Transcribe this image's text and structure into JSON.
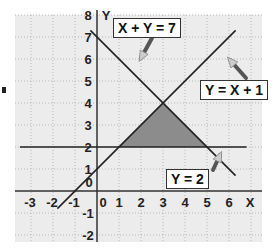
{
  "chart_data": {
    "type": "line",
    "title": "",
    "xlabel": "X",
    "ylabel": "Y",
    "xlim": [
      -3.7,
      7.5
    ],
    "ylim": [
      -2.3,
      8.2
    ],
    "grid": true,
    "x_ticks": [
      "-3",
      "-2",
      "-1",
      "0",
      "1",
      "2",
      "3",
      "4",
      "5",
      "6"
    ],
    "y_ticks": [
      "-2",
      "-1",
      "0",
      "1",
      "2",
      "3",
      "4",
      "5",
      "6",
      "7",
      "8"
    ],
    "series": [
      {
        "name": "X + Y = 7",
        "equation": "y = 7 - x",
        "x": [
          -0.3,
          6.3
        ],
        "y": [
          7.3,
          0.7
        ]
      },
      {
        "name": "Y = X + 1",
        "equation": "y = x + 1",
        "x": [
          -1.8,
          6.3
        ],
        "y": [
          -0.8,
          7.3
        ]
      },
      {
        "name": "Y = 2",
        "equation": "y = 2",
        "x": [
          -3.5,
          6.8
        ],
        "y": [
          2,
          2
        ]
      }
    ],
    "shaded_region": {
      "vertices": [
        [
          1,
          2
        ],
        [
          3,
          4
        ],
        [
          5,
          2
        ]
      ],
      "color": "#8c8c8c"
    },
    "annotations": [
      {
        "text": "X + Y = 7",
        "points_to": "line x+y=7"
      },
      {
        "text": "Y = X + 1",
        "points_to": "line y=x+1"
      },
      {
        "text": "Y = 2",
        "points_to": "line y=2"
      }
    ]
  },
  "labels": {
    "line1": "X + Y = 7",
    "line2": "Y = X + 1",
    "line3": "Y = 2",
    "x_axis": "X",
    "y_axis": "Y"
  },
  "colors": {
    "grid_bg": "#ececec",
    "grid_line": "#b8b8b8",
    "axis": "#333333",
    "shade": "#8c8c8c"
  }
}
